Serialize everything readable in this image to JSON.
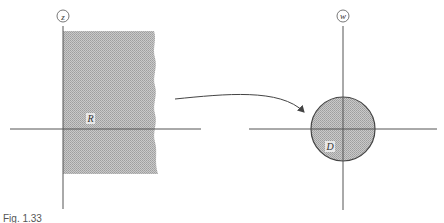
{
  "figure": {
    "caption": "Fig. 1.33",
    "left_plane": {
      "label": "z",
      "region_label": "R",
      "description": "right half-plane region (shaded, extending to the right, truncated with wavy edge)"
    },
    "right_plane": {
      "label": "w",
      "region_label": "D",
      "description": "shaded disk centered at origin"
    },
    "mapping_arrow": "curved arrow from z-plane to w-plane",
    "colors": {
      "axis": "#555555",
      "shade": "#bdbdbd",
      "outline": "#444444",
      "background": "#ffffff"
    }
  }
}
